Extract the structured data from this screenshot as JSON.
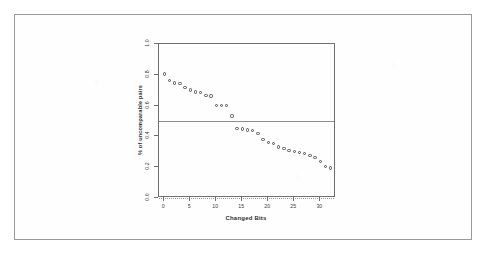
{
  "chart_data": {
    "type": "scatter",
    "title": "",
    "xlabel": "Changed Bits",
    "ylabel": "% of uncomparable pairs",
    "xlim": [
      -1,
      33
    ],
    "ylim": [
      0.0,
      1.0
    ],
    "grid": false,
    "legend": null,
    "xticks": [
      "0",
      "5",
      "10",
      "15",
      "20",
      "25",
      "30"
    ],
    "xtick_values": [
      0,
      5,
      10,
      15,
      20,
      25,
      30
    ],
    "yticks": [
      "0.0",
      "0.2",
      "0.4",
      "0.6",
      "0.8",
      "1.0"
    ],
    "ytick_values": [
      0.0,
      0.2,
      0.4,
      0.6,
      0.8,
      1.0
    ],
    "marker": "open-circle",
    "marker_color": "#4a4a4a",
    "x": [
      0,
      1,
      2,
      3,
      4,
      5,
      6,
      7,
      8,
      9,
      10,
      11,
      12,
      13,
      14,
      15,
      16,
      17,
      18,
      19,
      20,
      21,
      22,
      23,
      24,
      25,
      26,
      27,
      28,
      29,
      30,
      31,
      32
    ],
    "y": [
      0.806,
      0.762,
      0.746,
      0.744,
      0.716,
      0.702,
      0.688,
      0.684,
      0.666,
      0.662,
      0.6,
      0.6,
      0.6,
      0.533,
      0.452,
      0.448,
      0.442,
      0.438,
      0.42,
      0.378,
      0.362,
      0.352,
      0.33,
      0.32,
      0.31,
      0.302,
      0.296,
      0.288,
      0.276,
      0.264,
      0.236,
      0.206,
      0.196,
      0.196
    ],
    "reference_lines": [
      {
        "y": 0.5,
        "style": "solid",
        "color": "#8d8d8d"
      },
      {
        "y": 0.0,
        "style": "dotted",
        "color": "#9a9a9a"
      }
    ]
  },
  "page": {
    "border_color": "#9a9a9a",
    "background": "#ffffff"
  }
}
